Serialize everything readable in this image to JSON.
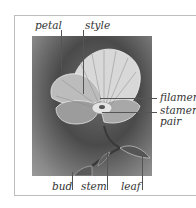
{
  "diagram": {
    "labels": {
      "top": [
        {
          "id": "petal",
          "text": "petal"
        },
        {
          "id": "style",
          "text": "style"
        }
      ],
      "right": [
        {
          "id": "filament",
          "text": "filament"
        },
        {
          "id": "stamen",
          "text": "stamen"
        },
        {
          "id": "pair",
          "text": "pair"
        }
      ],
      "bottom": [
        {
          "id": "bud",
          "text": "bud"
        },
        {
          "id": "stem",
          "text": "stem"
        },
        {
          "id": "leaf",
          "text": "leaf"
        }
      ]
    },
    "colors": {
      "frame": "#bdbdbd",
      "leader_line": "#555555",
      "label_text": "#333333",
      "panel_dark": "#4a4a4a",
      "panel_light": "#9a9a9a"
    }
  }
}
